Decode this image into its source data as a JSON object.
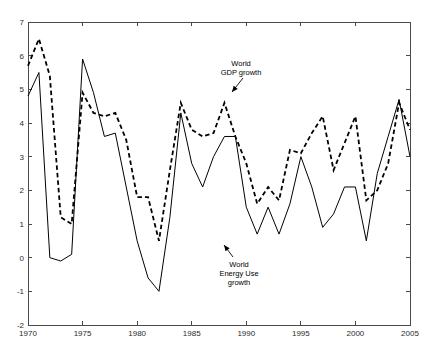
{
  "chart_data": {
    "type": "line",
    "title": "",
    "xlabel": "",
    "ylabel": "",
    "xlim": [
      1970,
      2005
    ],
    "ylim": [
      -2,
      7
    ],
    "xticks": [
      1970,
      1975,
      1980,
      1985,
      1990,
      1995,
      2000,
      2005
    ],
    "xtick_labels": [
      "1970",
      "1975",
      "1980",
      "1985",
      "1990",
      "1995",
      "2000",
      "2005"
    ],
    "yticks": [
      -2,
      -1,
      0,
      1,
      2,
      3,
      4,
      5,
      6,
      7
    ],
    "ytick_labels": [
      "-2",
      "-1",
      "0",
      "1",
      "2",
      "3",
      "4",
      "5",
      "6",
      "7"
    ],
    "grid": false,
    "legend": "none",
    "x": [
      1970,
      1971,
      1972,
      1973,
      1974,
      1975,
      1976,
      1977,
      1978,
      1979,
      1980,
      1981,
      1982,
      1983,
      1984,
      1985,
      1986,
      1987,
      1988,
      1989,
      1990,
      1991,
      1992,
      1993,
      1994,
      1995,
      1996,
      1997,
      1998,
      1999,
      2000,
      2001,
      2002,
      2003,
      2004,
      2005
    ],
    "series": [
      {
        "name": "World GDP growth",
        "style": "dashed",
        "values": [
          5.7,
          6.5,
          5.4,
          1.2,
          1.0,
          4.9,
          4.3,
          4.2,
          4.3,
          3.5,
          1.8,
          1.8,
          0.5,
          2.6,
          4.6,
          3.8,
          3.6,
          3.7,
          4.6,
          3.6,
          2.8,
          1.6,
          2.1,
          1.7,
          3.2,
          3.1,
          3.7,
          4.2,
          2.6,
          3.4,
          4.2,
          1.7,
          2.0,
          2.8,
          4.6,
          3.8
        ]
      },
      {
        "name": "World Energy Use growth",
        "style": "solid",
        "values": [
          4.8,
          5.5,
          0.0,
          -0.1,
          0.1,
          5.9,
          4.9,
          3.6,
          3.7,
          2.1,
          0.5,
          -0.6,
          -1.0,
          1.2,
          4.3,
          2.8,
          2.1,
          3.0,
          3.6,
          3.6,
          1.5,
          0.7,
          1.5,
          0.7,
          1.6,
          3.0,
          2.1,
          0.9,
          1.3,
          2.1,
          2.1,
          0.5,
          2.5,
          3.6,
          4.7,
          3.0
        ]
      }
    ],
    "annotations": [
      {
        "id": "gdp-annotation",
        "lines": [
          "World",
          "GDP growth"
        ],
        "target_x": 1988,
        "target_y": 4.6
      },
      {
        "id": "energy-annotation",
        "lines": [
          "World",
          "Energy Use",
          "growth"
        ],
        "target_x": 1990,
        "target_y": 1.5
      }
    ]
  }
}
